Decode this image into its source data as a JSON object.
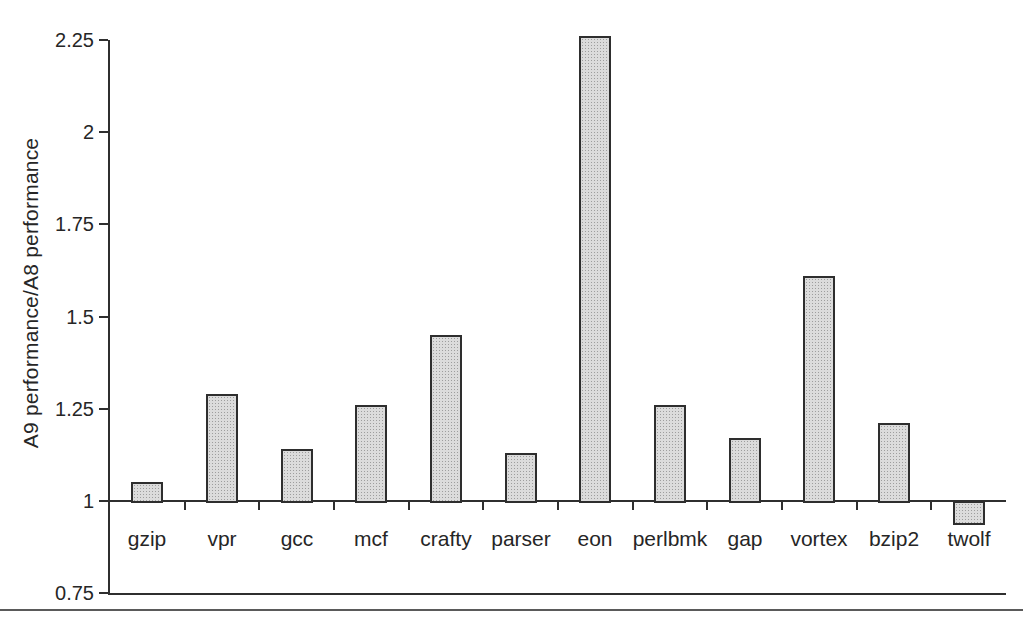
{
  "chart_data": {
    "type": "bar",
    "title": "",
    "xlabel": "",
    "ylabel": "A9 performance/A8 performance",
    "categories": [
      "gzip",
      "vpr",
      "gcc",
      "mcf",
      "crafty",
      "parser",
      "eon",
      "perlbmk",
      "gap",
      "vortex",
      "bzip2",
      "twolf"
    ],
    "values": [
      1.05,
      1.29,
      1.14,
      1.26,
      1.45,
      1.13,
      2.26,
      1.26,
      1.17,
      1.61,
      1.21,
      0.94
    ],
    "baseline": 1,
    "ylim": [
      0.75,
      2.25
    ],
    "yticks": [
      2.25,
      2,
      1.75,
      1.5,
      1.25,
      1,
      0.75
    ],
    "ytick_labels": [
      "2.25",
      "2",
      "1.75",
      "1.5",
      "1.25",
      "1",
      "0.75"
    ],
    "grid": false,
    "legend": null,
    "colors": {
      "background": "#ffffff",
      "bar_fill": "#dcdcdc",
      "bar_stipple": "#9e9e9e",
      "bar_border": "#2e2e2e",
      "axis": "#2f2f2f",
      "text": "#262626",
      "bottom_rule": "#5a5a5a"
    }
  }
}
